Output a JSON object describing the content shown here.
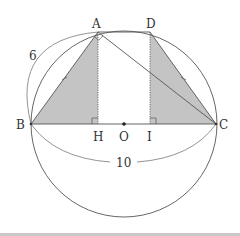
{
  "diagram": {
    "type": "geometry",
    "colors": {
      "stroke": "#555555",
      "shade": "#c4c4c4",
      "background": "#ffffff"
    },
    "circle": {
      "center": "O",
      "cx": 124,
      "cy": 124,
      "r": 93
    },
    "points": {
      "A": {
        "label": "A",
        "x": 98,
        "y": 32
      },
      "D": {
        "label": "D",
        "x": 150,
        "y": 32
      },
      "B": {
        "label": "B",
        "x": 31,
        "y": 124
      },
      "C": {
        "label": "C",
        "x": 216,
        "y": 124
      },
      "H": {
        "label": "H",
        "x": 98,
        "y": 124
      },
      "O": {
        "label": "O",
        "x": 124,
        "y": 124
      },
      "I": {
        "label": "I",
        "x": 150,
        "y": 124
      }
    },
    "segments": [
      "AB",
      "AD",
      "DC",
      "BC",
      "AC",
      "AH (dotted)",
      "DI (dotted)"
    ],
    "shaded_regions": [
      "triangle ABH",
      "triangle DIC"
    ],
    "marks": {
      "right_angles": [
        "BAC",
        "AHB",
        "DIC"
      ],
      "equal_ticks": [
        "AB",
        "DC"
      ]
    },
    "dimensions": [
      {
        "label": "6",
        "between": "B-A"
      },
      {
        "label": "10",
        "between": "B-C"
      }
    ]
  }
}
